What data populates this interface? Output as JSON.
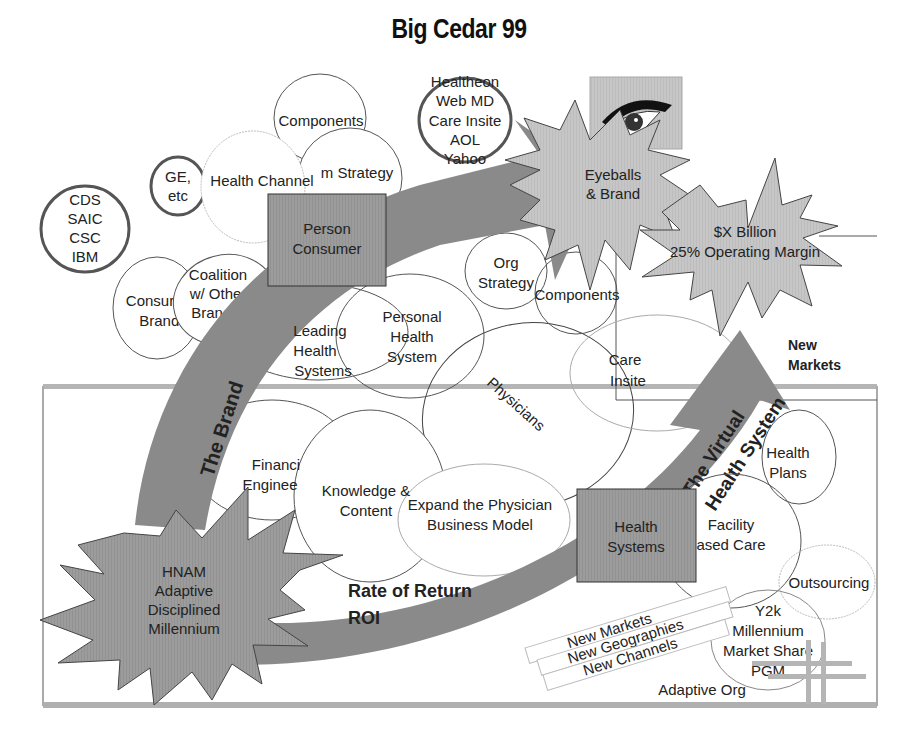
{
  "title": "Big Cedar 99",
  "colors": {
    "arrow": "#8a8a8a",
    "star_fill": "#c9c9c9",
    "box_fill": "#9a9a9a",
    "frame": "#a8a8a8",
    "line": "#555555",
    "light_line": "#b0b0b0"
  },
  "circles": {
    "cds": [
      "CDS",
      "SAIC",
      "CSC",
      "IBM"
    ],
    "ge": [
      "GE,",
      "etc"
    ],
    "health_channel": "Health Channel",
    "components_top": "Components",
    "m_strategy": "m Strategy",
    "healtheon": [
      "Healtheon",
      "Web MD",
      "Care Insite",
      "AOL",
      "Yahoo"
    ],
    "consumer_brands": [
      "Consur",
      "Brands"
    ],
    "coalition": [
      "Coalition",
      "w/ Other",
      "Brands"
    ],
    "leading_health": [
      "Leading",
      "Health",
      "Systems"
    ],
    "personal_health": [
      "Personal",
      "Health",
      "System"
    ],
    "org_strategy": [
      "Org",
      "Strategy"
    ],
    "components_mid": "Components",
    "care_insite": [
      "Care",
      "Insite"
    ],
    "physicians": "Physicians",
    "financial": [
      "Financi",
      "Enginee"
    ],
    "knowledge": [
      "Knowledge &",
      "Content"
    ],
    "expand": [
      "Expand the Physician",
      "Business Model"
    ],
    "health_plans": [
      "Health",
      "Plans"
    ],
    "facility": [
      "Facility",
      "ased Care"
    ],
    "outsourcing": "Outsourcing",
    "y2k": [
      "Y2k",
      "Millennium",
      "Market Share",
      "PGM"
    ]
  },
  "boxes": {
    "person_consumer": [
      "Person",
      "Consumer"
    ],
    "health_systems": [
      "Health",
      "Systems"
    ]
  },
  "stars": {
    "eyeballs": [
      "Eyeballs",
      "& Brand"
    ],
    "billion": [
      "$X Billion",
      "25% Operating Margin"
    ],
    "hnam": [
      "HNAM",
      "Adaptive",
      "Disciplined",
      "Millennium"
    ]
  },
  "arrows": {
    "brand": "The Brand",
    "virtual": [
      "The Virtual",
      "Health System"
    ],
    "roi": [
      "Rate of Return",
      "ROI"
    ]
  },
  "labels": {
    "new_markets_right": [
      "New",
      "Markets"
    ],
    "banners": [
      "New Markets",
      "New Geographies",
      "New Channels"
    ],
    "adaptive_org": "Adaptive Org"
  },
  "icons": {
    "eye": "eye-image"
  }
}
